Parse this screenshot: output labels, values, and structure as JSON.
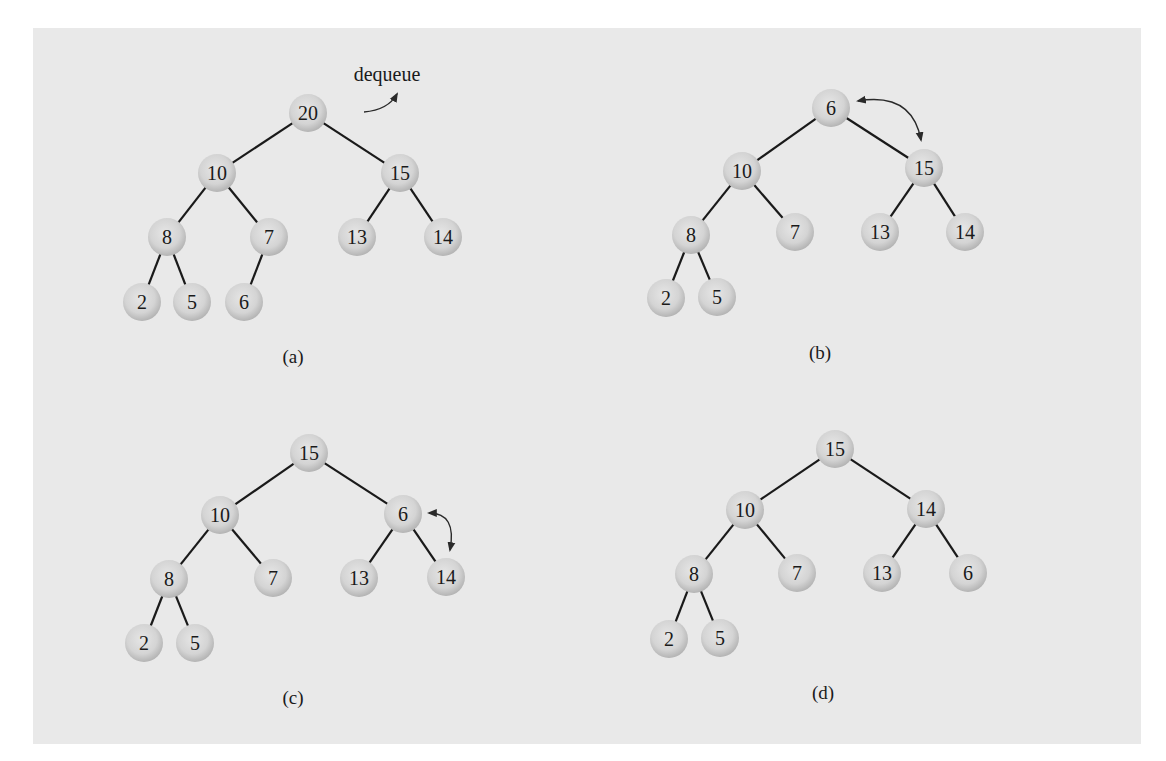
{
  "figure": {
    "panels": [
      {
        "id": "a",
        "caption": "(a)",
        "caption_pos": [
          293,
          363
        ],
        "annotation": {
          "text": "dequeue",
          "pos": [
            387,
            81
          ],
          "arrow": "M 364 112 Q 388 110 397 94"
        },
        "nodes": [
          {
            "id": "a-20",
            "value": "20",
            "x": 308,
            "y": 113
          },
          {
            "id": "a-10",
            "value": "10",
            "x": 217,
            "y": 173
          },
          {
            "id": "a-15",
            "value": "15",
            "x": 400,
            "y": 173
          },
          {
            "id": "a-8",
            "value": "8",
            "x": 167,
            "y": 237
          },
          {
            "id": "a-7",
            "value": "7",
            "x": 269,
            "y": 237
          },
          {
            "id": "a-13",
            "value": "13",
            "x": 357,
            "y": 237
          },
          {
            "id": "a-14",
            "value": "14",
            "x": 443,
            "y": 237
          },
          {
            "id": "a-2",
            "value": "2",
            "x": 142,
            "y": 302
          },
          {
            "id": "a-5",
            "value": "5",
            "x": 192,
            "y": 302
          },
          {
            "id": "a-6",
            "value": "6",
            "x": 244,
            "y": 302
          }
        ],
        "edges": [
          [
            "a-20",
            "a-10"
          ],
          [
            "a-20",
            "a-15"
          ],
          [
            "a-10",
            "a-8"
          ],
          [
            "a-10",
            "a-7"
          ],
          [
            "a-15",
            "a-13"
          ],
          [
            "a-15",
            "a-14"
          ],
          [
            "a-8",
            "a-2"
          ],
          [
            "a-8",
            "a-5"
          ],
          [
            "a-7",
            "a-6"
          ]
        ]
      },
      {
        "id": "b",
        "caption": "(b)",
        "caption_pos": [
          820,
          359
        ],
        "swap_arrow": "M 858 101 Q 912 92 921 140",
        "nodes": [
          {
            "id": "b-6",
            "value": "6",
            "x": 831,
            "y": 108
          },
          {
            "id": "b-10",
            "value": "10",
            "x": 742,
            "y": 171
          },
          {
            "id": "b-15",
            "value": "15",
            "x": 924,
            "y": 168
          },
          {
            "id": "b-8",
            "value": "8",
            "x": 691,
            "y": 235
          },
          {
            "id": "b-7",
            "value": "7",
            "x": 795,
            "y": 232
          },
          {
            "id": "b-13",
            "value": "13",
            "x": 880,
            "y": 232
          },
          {
            "id": "b-14",
            "value": "14",
            "x": 965,
            "y": 232
          },
          {
            "id": "b-2",
            "value": "2",
            "x": 666,
            "y": 298
          },
          {
            "id": "b-5",
            "value": "5",
            "x": 717,
            "y": 297
          }
        ],
        "edges": [
          [
            "b-6",
            "b-10"
          ],
          [
            "b-6",
            "b-15"
          ],
          [
            "b-10",
            "b-8"
          ],
          [
            "b-10",
            "b-7"
          ],
          [
            "b-15",
            "b-13"
          ],
          [
            "b-15",
            "b-14"
          ],
          [
            "b-8",
            "b-2"
          ],
          [
            "b-8",
            "b-5"
          ]
        ]
      },
      {
        "id": "c",
        "caption": "(c)",
        "caption_pos": [
          293,
          704
        ],
        "swap_arrow": "M 429 513 Q 457 513 450 550",
        "nodes": [
          {
            "id": "c-15",
            "value": "15",
            "x": 309,
            "y": 453
          },
          {
            "id": "c-10",
            "value": "10",
            "x": 220,
            "y": 515
          },
          {
            "id": "c-6",
            "value": "6",
            "x": 403,
            "y": 514
          },
          {
            "id": "c-8",
            "value": "8",
            "x": 169,
            "y": 579
          },
          {
            "id": "c-7",
            "value": "7",
            "x": 273,
            "y": 578
          },
          {
            "id": "c-13",
            "value": "13",
            "x": 359,
            "y": 578
          },
          {
            "id": "c-14",
            "value": "14",
            "x": 446,
            "y": 577
          },
          {
            "id": "c-2",
            "value": "2",
            "x": 144,
            "y": 643
          },
          {
            "id": "c-5",
            "value": "5",
            "x": 195,
            "y": 643
          }
        ],
        "edges": [
          [
            "c-15",
            "c-10"
          ],
          [
            "c-15",
            "c-6"
          ],
          [
            "c-10",
            "c-8"
          ],
          [
            "c-10",
            "c-7"
          ],
          [
            "c-6",
            "c-13"
          ],
          [
            "c-6",
            "c-14"
          ],
          [
            "c-8",
            "c-2"
          ],
          [
            "c-8",
            "c-5"
          ]
        ]
      },
      {
        "id": "d",
        "caption": "(d)",
        "caption_pos": [
          823,
          699
        ],
        "nodes": [
          {
            "id": "d-15",
            "value": "15",
            "x": 835,
            "y": 449
          },
          {
            "id": "d-10",
            "value": "10",
            "x": 745,
            "y": 510
          },
          {
            "id": "d-14",
            "value": "14",
            "x": 926,
            "y": 509
          },
          {
            "id": "d-8",
            "value": "8",
            "x": 694,
            "y": 574
          },
          {
            "id": "d-7",
            "value": "7",
            "x": 797,
            "y": 573
          },
          {
            "id": "d-13",
            "value": "13",
            "x": 882,
            "y": 573
          },
          {
            "id": "d-6",
            "value": "6",
            "x": 968,
            "y": 573
          },
          {
            "id": "d-2",
            "value": "2",
            "x": 669,
            "y": 639
          },
          {
            "id": "d-5",
            "value": "5",
            "x": 720,
            "y": 638
          }
        ],
        "edges": [
          [
            "d-15",
            "d-10"
          ],
          [
            "d-15",
            "d-14"
          ],
          [
            "d-10",
            "d-8"
          ],
          [
            "d-10",
            "d-7"
          ],
          [
            "d-14",
            "d-13"
          ],
          [
            "d-14",
            "d-6"
          ],
          [
            "d-8",
            "d-2"
          ],
          [
            "d-8",
            "d-5"
          ]
        ]
      }
    ]
  },
  "style": {
    "node_radius": 19,
    "node_fill_center": "#e4e4e4",
    "node_fill_edge": "#b9b9b9",
    "panel_bg": "#e9e9e9"
  }
}
